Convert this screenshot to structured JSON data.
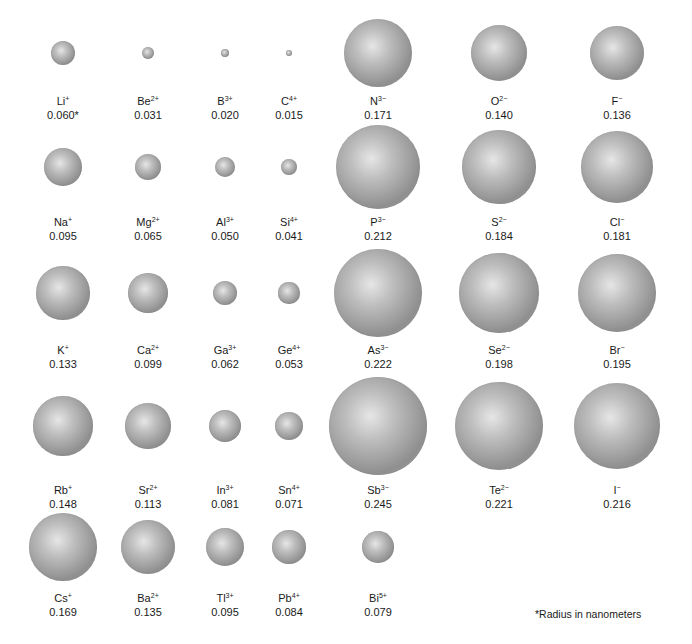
{
  "figure": {
    "footnote": "*Radius in nanometers",
    "sphere_color": "#9a9a9a",
    "highlight_color": "#e6e6e6"
  },
  "chart_data": {
    "type": "table",
    "unit": "nm",
    "columns": [
      "group1",
      "group2",
      "group13",
      "group14",
      "group15",
      "group16",
      "group17"
    ],
    "ions": [
      {
        "symbol": "Li",
        "charge": "+",
        "radius": "0.060*",
        "row": 1,
        "col": 1
      },
      {
        "symbol": "Be",
        "charge": "2+",
        "radius": "0.031",
        "row": 1,
        "col": 2
      },
      {
        "symbol": "B",
        "charge": "3+",
        "radius": "0.020",
        "row": 1,
        "col": 3
      },
      {
        "symbol": "C",
        "charge": "4+",
        "radius": "0.015",
        "row": 1,
        "col": 4
      },
      {
        "symbol": "N",
        "charge": "3−",
        "radius": "0.171",
        "row": 1,
        "col": 5
      },
      {
        "symbol": "O",
        "charge": "2−",
        "radius": "0.140",
        "row": 1,
        "col": 6
      },
      {
        "symbol": "F",
        "charge": "−",
        "radius": "0.136",
        "row": 1,
        "col": 7
      },
      {
        "symbol": "Na",
        "charge": "+",
        "radius": "0.095",
        "row": 2,
        "col": 1
      },
      {
        "symbol": "Mg",
        "charge": "2+",
        "radius": "0.065",
        "row": 2,
        "col": 2
      },
      {
        "symbol": "Al",
        "charge": "3+",
        "radius": "0.050",
        "row": 2,
        "col": 3
      },
      {
        "symbol": "Si",
        "charge": "4+",
        "radius": "0.041",
        "row": 2,
        "col": 4
      },
      {
        "symbol": "P",
        "charge": "3−",
        "radius": "0.212",
        "row": 2,
        "col": 5
      },
      {
        "symbol": "S",
        "charge": "2−",
        "radius": "0.184",
        "row": 2,
        "col": 6
      },
      {
        "symbol": "Cl",
        "charge": "−",
        "radius": "0.181",
        "row": 2,
        "col": 7
      },
      {
        "symbol": "K",
        "charge": "+",
        "radius": "0.133",
        "row": 3,
        "col": 1
      },
      {
        "symbol": "Ca",
        "charge": "2+",
        "radius": "0.099",
        "row": 3,
        "col": 2
      },
      {
        "symbol": "Ga",
        "charge": "3+",
        "radius": "0.062",
        "row": 3,
        "col": 3
      },
      {
        "symbol": "Ge",
        "charge": "4+",
        "radius": "0.053",
        "row": 3,
        "col": 4
      },
      {
        "symbol": "As",
        "charge": "3−",
        "radius": "0.222",
        "row": 3,
        "col": 5
      },
      {
        "symbol": "Se",
        "charge": "2−",
        "radius": "0.198",
        "row": 3,
        "col": 6
      },
      {
        "symbol": "Br",
        "charge": "−",
        "radius": "0.195",
        "row": 3,
        "col": 7
      },
      {
        "symbol": "Rb",
        "charge": "+",
        "radius": "0.148",
        "row": 4,
        "col": 1
      },
      {
        "symbol": "Sr",
        "charge": "2+",
        "radius": "0.113",
        "row": 4,
        "col": 2
      },
      {
        "symbol": "In",
        "charge": "3+",
        "radius": "0.081",
        "row": 4,
        "col": 3
      },
      {
        "symbol": "Sn",
        "charge": "4+",
        "radius": "0.071",
        "row": 4,
        "col": 4
      },
      {
        "symbol": "Sb",
        "charge": "3−",
        "radius": "0.245",
        "row": 4,
        "col": 5
      },
      {
        "symbol": "Te",
        "charge": "2−",
        "radius": "0.221",
        "row": 4,
        "col": 6
      },
      {
        "symbol": "I",
        "charge": "−",
        "radius": "0.216",
        "row": 4,
        "col": 7
      },
      {
        "symbol": "Cs",
        "charge": "+",
        "radius": "0.169",
        "row": 5,
        "col": 1
      },
      {
        "symbol": "Ba",
        "charge": "2+",
        "radius": "0.135",
        "row": 5,
        "col": 2
      },
      {
        "symbol": "Tl",
        "charge": "3+",
        "radius": "0.095",
        "row": 5,
        "col": 3
      },
      {
        "symbol": "Pb",
        "charge": "4+",
        "radius": "0.084",
        "row": 5,
        "col": 4
      },
      {
        "symbol": "Bi",
        "charge": "5+",
        "radius": "0.079",
        "row": 5,
        "col": 5
      }
    ]
  }
}
